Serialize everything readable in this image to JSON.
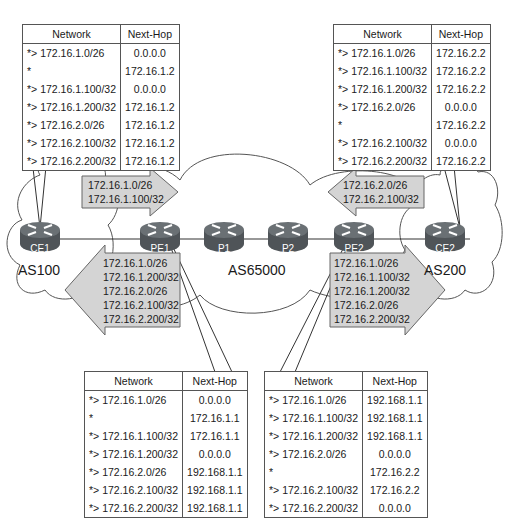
{
  "routers": {
    "ce1": "CE1",
    "pe1": "PE1",
    "p1": "P1",
    "p2": "P2",
    "pe2": "PE2",
    "ce2": "CE2"
  },
  "as_labels": {
    "left": "AS100",
    "core": "AS65000",
    "right": "AS200"
  },
  "icons": {
    "router": "router-icon",
    "cloud": "cloud-icon",
    "arrow": "advertisement-arrow-icon"
  },
  "colors": {
    "arrow_fill": "#d4d4d4",
    "router_body": "#5a5f63",
    "line": "#333333"
  },
  "advertisements": {
    "ce1_to_pe1": [
      "172.16.1.0/26",
      "172.16.1.100/32"
    ],
    "ce2_to_pe2": [
      "172.16.2.0/26",
      "172.16.2.100/32"
    ],
    "pe1_to_ce1": [
      "172.16.1.0/26",
      "172.16.1.200/32",
      "172.16.2.0/26",
      "172.16.2.100/32",
      "172.16.2.200/32"
    ],
    "pe2_to_ce2": [
      "172.16.1.0/26",
      "172.16.1.100/32",
      "172.16.1.200/32",
      "172.16.2.0/26",
      "172.16.2.200/32"
    ]
  },
  "tables": {
    "headers": {
      "network": "Network",
      "next_hop": "Next-Hop"
    },
    "ce1": [
      {
        "net": "*> 172.16.1.0/26",
        "nh": "0.0.0.0"
      },
      {
        "net": "*",
        "nh": "172.16.1.2"
      },
      {
        "net": "*> 172.16.1.100/32",
        "nh": "0.0.0.0"
      },
      {
        "net": "*> 172.16.1.200/32",
        "nh": "172.16.1.2"
      },
      {
        "net": "*> 172.16.2.0/26",
        "nh": "172.16.1.2"
      },
      {
        "net": "*> 172.16.2.100/32",
        "nh": "172.16.1.2"
      },
      {
        "net": "*> 172.16.2.200/32",
        "nh": "172.16.1.2"
      }
    ],
    "ce2": [
      {
        "net": "*> 172.16.1.0/26",
        "nh": "172.16.2.2"
      },
      {
        "net": "*> 172.16.1.100/32",
        "nh": "172.16.2.2"
      },
      {
        "net": "*> 172.16.1.200/32",
        "nh": "172.16.2.2"
      },
      {
        "net": "*> 172.16.2.0/26",
        "nh": "0.0.0.0"
      },
      {
        "net": "*",
        "nh": "172.16.2.2"
      },
      {
        "net": "*> 172.16.2.100/32",
        "nh": "0.0.0.0"
      },
      {
        "net": "*> 172.16.2.200/32",
        "nh": "172.16.2.2"
      }
    ],
    "pe1": [
      {
        "net": "*> 172.16.1.0/26",
        "nh": "0.0.0.0"
      },
      {
        "net": "*",
        "nh": "172.16.1.1"
      },
      {
        "net": "*> 172.16.1.100/32",
        "nh": "172.16.1.1"
      },
      {
        "net": "*> 172.16.1.200/32",
        "nh": "0.0.0.0"
      },
      {
        "net": "*> 172.16.2.0/26",
        "nh": "192.168.1.1"
      },
      {
        "net": "*> 172.16.2.100/32",
        "nh": "192.168.1.1"
      },
      {
        "net": "*> 172.16.2.200/32",
        "nh": "192.168.1.1"
      }
    ],
    "pe2": [
      {
        "net": "*> 172.16.1.0/26",
        "nh": "192.168.1.1"
      },
      {
        "net": "*> 172.16.1.100/32",
        "nh": "192.168.1.1"
      },
      {
        "net": "*> 172.16.1.200/32",
        "nh": "192.168.1.1"
      },
      {
        "net": "*> 172.16.2.0/26",
        "nh": "0.0.0.0"
      },
      {
        "net": "*",
        "nh": "172.16.2.2"
      },
      {
        "net": "*> 172.16.2.100/32",
        "nh": "172.16.2.2"
      },
      {
        "net": "*> 172.16.2.200/32",
        "nh": "0.0.0.0"
      }
    ]
  }
}
